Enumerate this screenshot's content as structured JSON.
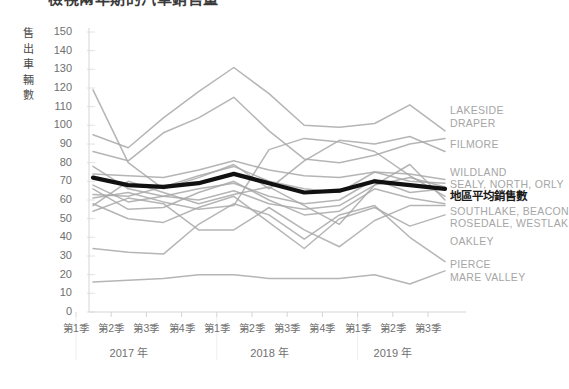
{
  "chart": {
    "title": "檢視兩年期的汽車銷售量",
    "y_axis_title_chars": [
      "售",
      "出",
      "車",
      "輛",
      "數"
    ],
    "y_axis_title": "售出車輛數",
    "y_ticks": [
      "150",
      "140",
      "130",
      "120",
      "110",
      "100",
      "90",
      "80",
      "70",
      "60",
      "50",
      "40",
      "30",
      "20",
      "10",
      "0"
    ],
    "x_ticks": [
      "第1季",
      "第2季",
      "第3季",
      "第4季",
      "第1季",
      "第2季",
      "第3季",
      "第4季",
      "第1季",
      "第2季",
      "第3季"
    ],
    "year_groups": [
      "2017 年",
      "2018 年",
      "2019 年"
    ]
  },
  "series_labels": [
    {
      "text": "LAKESIDE",
      "y": 110
    },
    {
      "text": "DRAPER",
      "y": 123
    },
    {
      "text": "FILMORE",
      "y": 144
    },
    {
      "text": "WILDLAND",
      "y": 172
    },
    {
      "text": "SEALY, NORTH, ORLY",
      "y": 184
    },
    {
      "text": "地區平均銷售數",
      "y": 196,
      "highlight": true
    },
    {
      "text": "SOUTHLAKE, BEACON",
      "y": 211
    },
    {
      "text": "ROSEDALE, WESTLAK",
      "y": 223
    },
    {
      "text": "OAKLEY",
      "y": 241
    },
    {
      "text": "PIERCE",
      "y": 264
    },
    {
      "text": "MARE VALLEY",
      "y": 277
    }
  ],
  "colors": {
    "series_gray": "#a8a8a8",
    "highlight_black": "#111111",
    "grid": "#e2e2e2",
    "axis": "#d5d5d5",
    "tick_text": "#6f6f6f",
    "label_text": "#a6a6a6"
  },
  "chart_data": {
    "type": "line",
    "title": "檢視兩年期的汽車銷售量",
    "xlabel": "",
    "ylabel": "售出車輛數",
    "ylim": [
      0,
      150
    ],
    "y_tick_step": 10,
    "grid": true,
    "legend": "right-side direct labels",
    "categories": [
      "2017 第1季",
      "2017 第2季",
      "2017 第3季",
      "2017 第4季",
      "2018 第1季",
      "2018 第2季",
      "2018 第3季",
      "2018 第4季",
      "2019 第1季",
      "2019 第2季",
      "2019 第3季"
    ],
    "series": [
      {
        "name": "地區平均銷售數",
        "highlight": true,
        "color": "#111111",
        "values": [
          72,
          68,
          67,
          69,
          74,
          69,
          64,
          65,
          70,
          68,
          66
        ]
      },
      {
        "name": "LAKESIDE",
        "color": "#a8a8a8",
        "values": [
          95,
          88,
          104,
          118,
          131,
          117,
          100,
          99,
          101,
          111,
          97
        ]
      },
      {
        "name": "DRAPER",
        "color": "#a8a8a8",
        "values": [
          86,
          81,
          96,
          104,
          115,
          97,
          82,
          80,
          84,
          90,
          93
        ]
      },
      {
        "name": "FILMORE",
        "color": "#a8a8a8",
        "values": [
          119,
          80,
          66,
          72,
          79,
          66,
          81,
          92,
          90,
          94,
          86
        ]
      },
      {
        "name": "WILDLAND",
        "color": "#a8a8a8",
        "values": [
          74,
          73,
          72,
          76,
          81,
          76,
          73,
          72,
          75,
          74,
          71
        ]
      },
      {
        "name": "SEALY",
        "color": "#a8a8a8",
        "values": [
          63,
          62,
          67,
          73,
          78,
          70,
          66,
          64,
          75,
          70,
          69
        ]
      },
      {
        "name": "NORTH",
        "color": "#a8a8a8",
        "values": [
          78,
          66,
          62,
          60,
          65,
          58,
          55,
          57,
          68,
          72,
          67
        ]
      },
      {
        "name": "ORLY",
        "color": "#a8a8a8",
        "values": [
          68,
          59,
          62,
          66,
          69,
          62,
          58,
          60,
          71,
          64,
          66
        ]
      },
      {
        "name": "SOUTHLAKE",
        "color": "#a8a8a8",
        "values": [
          61,
          64,
          59,
          55,
          57,
          87,
          93,
          91,
          86,
          73,
          62
        ]
      },
      {
        "name": "BEACON",
        "color": "#a8a8a8",
        "values": [
          57,
          70,
          64,
          58,
          63,
          67,
          57,
          47,
          68,
          79,
          60
        ]
      },
      {
        "name": "ROSEDALE",
        "color": "#a8a8a8",
        "values": [
          66,
          55,
          56,
          64,
          70,
          60,
          52,
          54,
          66,
          61,
          58
        ]
      },
      {
        "name": "WESTLAKE",
        "color": "#a8a8a8",
        "values": [
          54,
          61,
          58,
          44,
          44,
          56,
          44,
          35,
          49,
          57,
          57
        ]
      },
      {
        "name": "OAKLEY",
        "color": "#a8a8a8",
        "values": [
          58,
          50,
          48,
          56,
          62,
          48,
          34,
          50,
          56,
          46,
          52
        ]
      },
      {
        "name": "PIERCE",
        "color": "#a8a8a8",
        "values": [
          34,
          32,
          31,
          47,
          58,
          52,
          39,
          52,
          57,
          40,
          27
        ]
      },
      {
        "name": "MARE VALLEY",
        "color": "#a8a8a8",
        "values": [
          16,
          17,
          18,
          20,
          20,
          18,
          18,
          18,
          20,
          15,
          22
        ]
      }
    ]
  },
  "plot_geometry": {
    "x_left": 93,
    "x_right": 445,
    "y_top_value": 150,
    "y_top_px": 32,
    "y_bottom_value": 0,
    "y_bottom_px": 312
  }
}
